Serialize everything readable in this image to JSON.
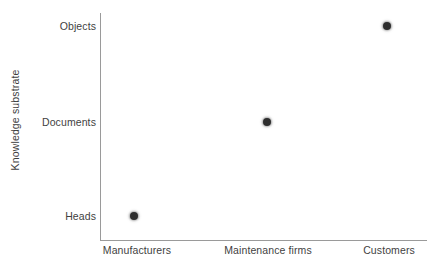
{
  "chart_data": {
    "type": "scatter",
    "title": "",
    "xlabel": "",
    "ylabel": "Knowledge substrate",
    "grid": false,
    "legend": false,
    "categories": [
      "Manufacturers",
      "Maintenance firms",
      "Customers"
    ],
    "y_categories": [
      "Heads",
      "Documents",
      "Objects"
    ],
    "points": [
      {
        "x": "Manufacturers",
        "y": "Heads",
        "x_index": 0,
        "y_index": 0
      },
      {
        "x": "Maintenance firms",
        "y": "Documents",
        "x_index": 1,
        "y_index": 1
      },
      {
        "x": "Customers",
        "y": "Objects",
        "x_index": 2,
        "y_index": 2
      }
    ],
    "series": [
      {
        "name": "",
        "values": [
          {
            "x": "Manufacturers",
            "y": "Heads"
          },
          {
            "x": "Maintenance firms",
            "y": "Documents"
          },
          {
            "x": "Customers",
            "y": "Objects"
          }
        ]
      }
    ],
    "marker_color": "#2e2e2e",
    "axis_color": "#9a9a9a",
    "background_color": "#ffffff",
    "text_color": "#3f3f3f"
  },
  "axes": {
    "y_label": "Knowledge substrate",
    "y_ticks": [
      {
        "label": "Objects",
        "px": 26
      },
      {
        "label": "Documents",
        "px": 122
      },
      {
        "label": "Heads",
        "px": 216
      }
    ],
    "x_ticks": [
      {
        "label": "Manufacturers",
        "px": 137
      },
      {
        "label": "Maintenance firms",
        "px": 268
      },
      {
        "label": "Customers",
        "px": 389
      }
    ]
  },
  "markers": [
    {
      "name": "point-manufacturers-heads",
      "cx": 134,
      "cy": 216
    },
    {
      "name": "point-maintenance-documents",
      "cx": 267,
      "cy": 122
    },
    {
      "name": "point-customers-objects",
      "cx": 387,
      "cy": 26
    }
  ]
}
